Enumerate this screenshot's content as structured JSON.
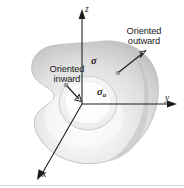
{
  "figure": {
    "background_color": "#ffffff",
    "ink_color": "#1b1b1b",
    "surface_fill_light": "#f4f4f4",
    "surface_fill_mid": "#dcdcdc",
    "surface_fill_dark": "#bdbdbd",
    "hole_fill": "#fbfbfb"
  },
  "axes": {
    "z_label": "z",
    "y_label": "y",
    "x_label": "x"
  },
  "symbols": {
    "sigma": "σ",
    "sigma_a_base": "σ",
    "sigma_a_sub": "a"
  },
  "callouts": [
    {
      "id": "oriented-outward",
      "line1": "Oriented",
      "line2": "outward"
    },
    {
      "id": "oriented-inward",
      "line1": "Oriented",
      "line2": "inward"
    }
  ],
  "icons": {
    "outward_arrow": "arrow-outward-icon",
    "inward_arrow": "arrow-inward-icon",
    "z_axis_arrow": "arrowhead-up-icon",
    "y_axis_arrow": "arrowhead-right-icon",
    "x_axis_arrow": "arrowhead-downleft-icon"
  }
}
